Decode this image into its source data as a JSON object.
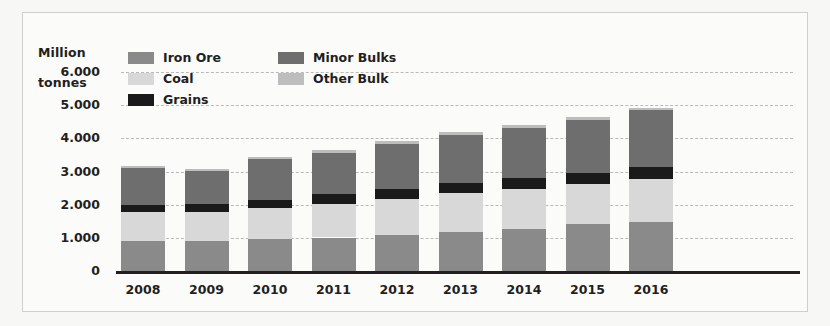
{
  "chart_data": {
    "type": "bar",
    "subtype": "stacked-bar",
    "title": "",
    "ylabel": "Million tonnes",
    "xlabel": "",
    "ylim": [
      0,
      6000
    ],
    "ytick_labels": [
      "6.000",
      "5.000",
      "4.000",
      "3.000",
      "2.000",
      "1.000",
      "0"
    ],
    "ytick_values": [
      6000,
      5000,
      4000,
      3000,
      2000,
      1000,
      0
    ],
    "grid": true,
    "grid_style": "dashed",
    "legend_position": "top-left-inside",
    "categories": [
      "2008",
      "2009",
      "2010",
      "2011",
      "2012",
      "2013",
      "2014",
      "2015",
      "2016"
    ],
    "series": [
      {
        "name": "Iron Ore",
        "color": "#8a8a8a",
        "values": [
          900,
          900,
          960,
          1010,
          1080,
          1180,
          1280,
          1420,
          1480
        ]
      },
      {
        "name": "Coal",
        "color": "#d8d8d8",
        "values": [
          880,
          890,
          930,
          1020,
          1080,
          1170,
          1180,
          1200,
          1300
        ]
      },
      {
        "name": "Grains",
        "color": "#1a1a1a",
        "values": [
          220,
          230,
          260,
          290,
          310,
          310,
          330,
          340,
          360
        ]
      },
      {
        "name": "Minor Bulks",
        "color": "#6e6e6e",
        "values": [
          1100,
          1000,
          1220,
          1250,
          1370,
          1450,
          1530,
          1590,
          1700
        ]
      },
      {
        "name": "Other Bulk",
        "color": "#bdbdbd",
        "values": [
          60,
          50,
          60,
          70,
          70,
          80,
          80,
          80,
          80
        ]
      }
    ],
    "totals": [
      3160,
      3070,
      3430,
      3640,
      3910,
      4190,
      4400,
      4630,
      4920
    ],
    "stack_order_bottom_to_top": [
      "Iron Ore",
      "Coal",
      "Grains",
      "Minor Bulks",
      "Other Bulk"
    ]
  },
  "axis": {
    "y_title_line1": "Million",
    "y_title_line2": "tonnes"
  },
  "legend": {
    "rows": [
      [
        {
          "label": "Iron Ore",
          "swatch": "#8a8a8a"
        },
        {
          "label": "Minor Bulks",
          "swatch": "#6e6e6e"
        }
      ],
      [
        {
          "label": "Coal",
          "swatch": "#d8d8d8"
        },
        {
          "label": "Other Bulk",
          "swatch": "#bdbdbd"
        }
      ],
      [
        {
          "label": "Grains",
          "swatch": "#1a1a1a"
        }
      ]
    ]
  }
}
